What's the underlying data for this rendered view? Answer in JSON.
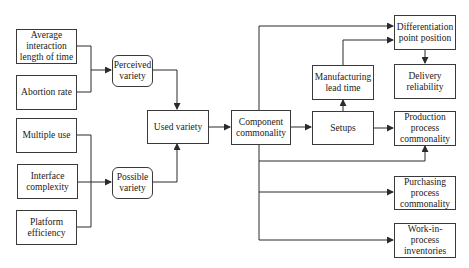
{
  "diagram": {
    "nodes": {
      "avg_interaction": "Average interaction length of time",
      "abortion_rate": "Abortion rate",
      "multiple_use": "Multiple use",
      "interface_complexity": "Interface complexity",
      "platform_efficiency": "Platform efficiency",
      "perceived_variety": "Perceived variety",
      "possible_variety": "Possible variety",
      "used_variety": "Used variety",
      "component_commonality": "Component commonality",
      "setups": "Setups",
      "manufacturing_lead_time": "Manufacturing lead time",
      "differentiation_point": "Differentiation point position",
      "delivery_reliability": "Delivery reliability",
      "production_commonality": "Production process commonality",
      "purchasing_commonality": "Purchasing process commonality",
      "wip_inventories": "Work-in-process inventories"
    },
    "edges": [
      [
        "avg_interaction",
        "perceived_variety"
      ],
      [
        "abortion_rate",
        "perceived_variety"
      ],
      [
        "multiple_use",
        "possible_variety"
      ],
      [
        "interface_complexity",
        "possible_variety"
      ],
      [
        "platform_efficiency",
        "possible_variety"
      ],
      [
        "perceived_variety",
        "used_variety"
      ],
      [
        "possible_variety",
        "used_variety"
      ],
      [
        "used_variety",
        "component_commonality"
      ],
      [
        "component_commonality",
        "setups"
      ],
      [
        "component_commonality",
        "differentiation_point"
      ],
      [
        "component_commonality",
        "production_commonality"
      ],
      [
        "component_commonality",
        "purchasing_commonality"
      ],
      [
        "component_commonality",
        "wip_inventories"
      ],
      [
        "setups",
        "manufacturing_lead_time"
      ],
      [
        "setups",
        "production_commonality"
      ],
      [
        "manufacturing_lead_time",
        "differentiation_point"
      ],
      [
        "differentiation_point",
        "delivery_reliability"
      ]
    ],
    "colors": {
      "line": "#2b2b2b",
      "box_border": "#3a3a3a",
      "background": "#ffffff"
    }
  }
}
